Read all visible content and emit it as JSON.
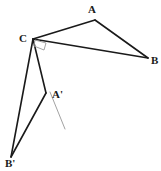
{
  "figure": {
    "name": "triangle-reflection-figure",
    "background_color": "#ffffff",
    "stroke_color": "#1a1a1a",
    "thin_stroke_color": "#8a8a8a",
    "marker_color": "#9a9a9a",
    "labels": {
      "a": "A",
      "b": "B",
      "c": "C",
      "a_prime": "A'",
      "b_prime": "B'"
    },
    "points": {
      "A": {
        "x": 95,
        "y": 20
      },
      "B": {
        "x": 148,
        "y": 58
      },
      "C": {
        "x": 33,
        "y": 39
      },
      "A_prime": {
        "x": 46,
        "y": 93
      },
      "B_prime": {
        "x": 11,
        "y": 157
      }
    },
    "label_positions": {
      "A": {
        "x": 88,
        "y": 4
      },
      "B": {
        "x": 151,
        "y": 55
      },
      "C": {
        "x": 19,
        "y": 33
      },
      "A_prime": {
        "x": 52,
        "y": 89
      },
      "B_prime": {
        "x": 5,
        "y": 158
      }
    },
    "segments": [
      {
        "name": "segment-CA",
        "from": "C",
        "to": "A"
      },
      {
        "name": "segment-AB",
        "from": "A",
        "to": "B"
      },
      {
        "name": "segment-CB",
        "from": "C",
        "to": "B"
      },
      {
        "name": "segment-CBprime",
        "from": "C",
        "to": "B_prime"
      },
      {
        "name": "segment-CAprime",
        "from": "C",
        "to": "A_prime"
      },
      {
        "name": "segment-AprimeBprime",
        "from": "A_prime",
        "to": "B_prime"
      }
    ],
    "paths": {
      "segment_CA": "M 33 39 L 95 20",
      "segment_AB": "M 95 20 L 148 58",
      "segment_CB": "M 33 39 L 148 58",
      "segment_CBprime": "M 33 39 L 11 157",
      "segment_CAprime": "M 33 39 L 46 93",
      "segment_AprimeBprime": "M 46 93 L 11 157",
      "thin_guide_line": "M 50 92 L 65 129",
      "right_angle_marker": "M 35 40 L 46 43 L 44 50 L 34 46 Z"
    }
  }
}
